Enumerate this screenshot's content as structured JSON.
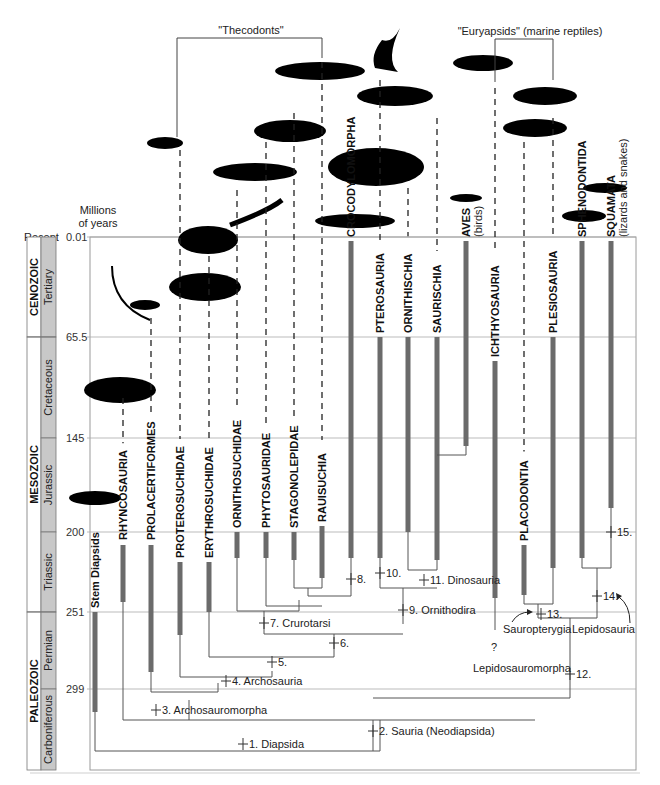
{
  "figure": {
    "axis_title_line1": "Millions",
    "axis_title_line2": "of years",
    "recent_label": "Recent",
    "time_ticks": [
      {
        "label": "0.01",
        "y": 237
      },
      {
        "label": "65.5",
        "y": 337
      },
      {
        "label": "145",
        "y": 438
      },
      {
        "label": "200",
        "y": 532
      },
      {
        "label": "251",
        "y": 612
      },
      {
        "label": "299",
        "y": 689
      }
    ],
    "eras": [
      {
        "name": "CENOZOIC",
        "y0": 237,
        "y1": 337
      },
      {
        "name": "MESOZOIC",
        "y0": 337,
        "y1": 612
      },
      {
        "name": "PALEOZOIC",
        "y0": 612,
        "y1": 770
      }
    ],
    "periods": [
      {
        "name": "Tertiary",
        "y0": 237,
        "y1": 337
      },
      {
        "name": "Cretaceous",
        "y0": 337,
        "y1": 438
      },
      {
        "name": "Jurassic",
        "y0": 438,
        "y1": 532
      },
      {
        "name": "Triassic",
        "y0": 532,
        "y1": 612
      },
      {
        "name": "Permian",
        "y0": 612,
        "y1": 689
      },
      {
        "name": "Carboniferous",
        "y0": 689,
        "y1": 770
      }
    ],
    "group_labels": {
      "thecodonts": "\"Thecodonts\"",
      "euryapsids": "\"Euryapsids\" (marine reptiles)"
    },
    "taxa": [
      {
        "name": "Stem Diapsids",
        "sub": "",
        "x": 95,
        "bar_top": 612,
        "bar_bot": 712,
        "label_y": 608
      },
      {
        "name": "RHYNCOSAURIA",
        "sub": "",
        "x": 123,
        "bar_top": 545,
        "bar_bot": 602,
        "label_y": 540
      },
      {
        "name": "PROLACERTIFORMES",
        "sub": "",
        "x": 151,
        "bar_top": 545,
        "bar_bot": 672,
        "label_y": 540
      },
      {
        "name": "PROTEROSUCHIDAE",
        "sub": "",
        "x": 180,
        "bar_top": 562,
        "bar_bot": 635,
        "label_y": 558
      },
      {
        "name": "ERYTHROSUCHIDAE",
        "sub": "",
        "x": 209,
        "bar_top": 562,
        "bar_bot": 612,
        "label_y": 558
      },
      {
        "name": "ORNITHOSUCHIDAE",
        "sub": "",
        "x": 237,
        "bar_top": 532,
        "bar_bot": 558,
        "label_y": 528
      },
      {
        "name": "PHYTOSAURIDAE",
        "sub": "",
        "x": 266,
        "bar_top": 532,
        "bar_bot": 558,
        "label_y": 528
      },
      {
        "name": "STAGONOLEPIDAE",
        "sub": "",
        "x": 294,
        "bar_top": 532,
        "bar_bot": 560,
        "label_y": 528
      },
      {
        "name": "RAUISUCHIA",
        "sub": "",
        "x": 322,
        "bar_top": 526,
        "bar_bot": 578,
        "label_y": 522
      },
      {
        "name": "CROCODYLOMORPHA",
        "sub": "",
        "x": 351,
        "bar_top": 241,
        "bar_bot": 558,
        "label_y": 237
      },
      {
        "name": "PTEROSAURIA",
        "sub": "",
        "x": 380,
        "bar_top": 337,
        "bar_bot": 558,
        "label_y": 333
      },
      {
        "name": "ORNITHISCHIA",
        "sub": "",
        "x": 408,
        "bar_top": 337,
        "bar_bot": 532,
        "label_y": 333
      },
      {
        "name": "SAURISCHIA",
        "sub": "",
        "x": 437,
        "bar_top": 337,
        "bar_bot": 560,
        "label_y": 333
      },
      {
        "name": "AVES",
        "sub": "(birds)",
        "x": 466,
        "bar_top": 241,
        "bar_bot": 446,
        "label_y": 237
      },
      {
        "name": "ICHTHYOSAURIA",
        "sub": "",
        "x": 495,
        "bar_top": 361,
        "bar_bot": 598,
        "label_y": 357
      },
      {
        "name": "PLACODONTIA",
        "sub": "",
        "x": 524,
        "bar_top": 545,
        "bar_bot": 595,
        "label_y": 541
      },
      {
        "name": "PLESIOSAURIA",
        "sub": "",
        "x": 553,
        "bar_top": 337,
        "bar_bot": 568,
        "label_y": 333
      },
      {
        "name": "SPHENODONTIDA",
        "sub": "",
        "x": 582,
        "bar_top": 241,
        "bar_bot": 558,
        "label_y": 237
      },
      {
        "name": "SQUAMATA",
        "sub": "(lizards and snakes)",
        "x": 611,
        "bar_top": 241,
        "bar_bot": 508,
        "label_y": 237
      }
    ],
    "nodes": [
      {
        "label": "1. Diapsida",
        "x": 243,
        "y": 744
      },
      {
        "label": "2. Sauria (Neodiapsida)",
        "x": 373,
        "y": 731
      },
      {
        "label": "3. Archosauromorpha",
        "x": 156,
        "y": 710
      },
      {
        "label": "4. Archosauria",
        "x": 226,
        "y": 681
      },
      {
        "label": "5.",
        "x": 272,
        "y": 662
      },
      {
        "label": "6.",
        "x": 334,
        "y": 643
      },
      {
        "label": "7. Crurotarsi",
        "x": 264,
        "y": 623
      },
      {
        "label": "8.",
        "x": 351,
        "y": 579
      },
      {
        "label": "9. Ornithodira",
        "x": 403,
        "y": 610
      },
      {
        "label": "10.",
        "x": 380,
        "y": 573
      },
      {
        "label": "11. Dinosauria",
        "x": 424,
        "y": 580
      },
      {
        "label": "12.",
        "x": 570,
        "y": 674
      },
      {
        "label": "13.",
        "x": 541,
        "y": 614
      },
      {
        "label": "14.",
        "x": 597,
        "y": 596
      },
      {
        "label": "15.",
        "x": 611,
        "y": 532
      }
    ],
    "annotations": {
      "question_mark": "?",
      "sauropterygia": "Sauropterygia",
      "lepidosauria": "Lepidosauria",
      "lepidosauromorpha": "Lepidosauromorpha"
    },
    "colors": {
      "bar": "#6b6b6b",
      "frame": "#9a9a9a",
      "period_fill": "#c8c8c8",
      "silhouette": "#000000",
      "line": "#555555"
    }
  }
}
